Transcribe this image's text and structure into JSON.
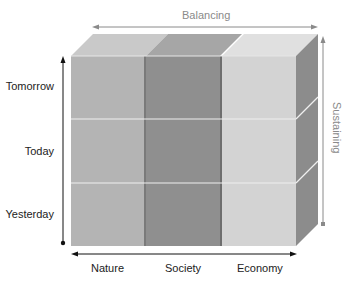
{
  "diagram": {
    "top_axis": {
      "label": "Balancing",
      "color": "#8a8a8a"
    },
    "right_axis": {
      "label": "Sustaining",
      "color": "#8a8a8a"
    },
    "left_axis": {
      "rows": [
        "Tomorrow",
        "Today",
        "Yesterday"
      ]
    },
    "bottom_axis": {
      "columns": [
        "Nature",
        "Society",
        "Economy"
      ]
    },
    "colors": {
      "nature_front": "#b4b4b4",
      "nature_top": "#c9c9c9",
      "society_front": "#8f8f8f",
      "society_top": "#a6a6a6",
      "economy_front": "#d3d3d3",
      "economy_top": "#e0e0e0",
      "side_face": "#8c8c8c",
      "divider": "#f0f0f0",
      "axis_dark": "#111111",
      "axis_gray": "#8a8a8a"
    }
  }
}
